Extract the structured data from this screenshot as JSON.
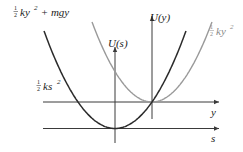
{
  "diagram": {
    "colors": {
      "axis": "#3a3a3a",
      "dark_curve": "#2b2b2b",
      "light_curve": "#9a9a9a",
      "dark_label": "#222222",
      "light_label": "#8a8a8a"
    },
    "axes": {
      "s_axis_label": "s",
      "y_axis_label": "y",
      "U_s_label": "U(s)",
      "U_y_label": "U(y)"
    },
    "curves": [
      {
        "name": "dark-parabola",
        "label_num": "1",
        "label_den": "2",
        "label_expr": "ky",
        "label_exp": "2",
        "label_tail": " + mgy",
        "description": "1/2 ky^2 + mgy, also equal to 1/2 ks^2"
      },
      {
        "name": "light-parabola",
        "label_num": "1",
        "label_den": "2",
        "label_expr": "ky",
        "label_exp": "2",
        "description": "1/2 ky^2"
      }
    ],
    "ks_label": {
      "num": "1",
      "den": "2",
      "expr": "ks",
      "exp": "2"
    }
  }
}
